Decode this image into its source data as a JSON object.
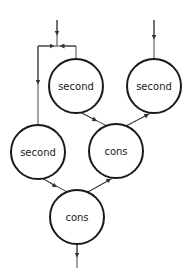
{
  "diagram": {
    "type": "dataflow-graph",
    "nodes": [
      {
        "id": "n1",
        "label": "second",
        "cx": 76,
        "cy": 86,
        "r": 27
      },
      {
        "id": "n2",
        "label": "second",
        "cx": 154,
        "cy": 86,
        "r": 27
      },
      {
        "id": "n3",
        "label": "second",
        "cx": 38,
        "cy": 152,
        "r": 27
      },
      {
        "id": "n4",
        "label": "cons",
        "cx": 116,
        "cy": 151,
        "r": 27
      },
      {
        "id": "n5",
        "label": "cons",
        "cx": 77,
        "cy": 217,
        "r": 27
      }
    ],
    "edges": [
      {
        "from": "input-left",
        "to": "fork",
        "desc": "external input splitting to n1 and n3"
      },
      {
        "from": "fork",
        "to": "n3"
      },
      {
        "from": "fork",
        "to": "n1"
      },
      {
        "from": "input-right",
        "to": "n2"
      },
      {
        "from": "n1",
        "to": "n4"
      },
      {
        "from": "n2",
        "to": "n4"
      },
      {
        "from": "n3",
        "to": "n5"
      },
      {
        "from": "n4",
        "to": "n5"
      },
      {
        "from": "n5",
        "to": "output"
      }
    ],
    "colors": {
      "stroke": "#1a1a1a",
      "edge": "#444444",
      "background": "#ffffff"
    }
  }
}
